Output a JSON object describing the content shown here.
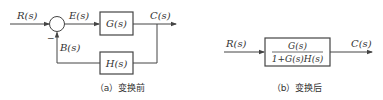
{
  "diagram_a": {
    "input_label": "R(s)",
    "error_label": "E(s)",
    "forward_block": "G(s)",
    "output_label": "C(s)",
    "feedback_signal_label": "B(s)",
    "feedback_block": "H(s)",
    "feedback_sign": "−",
    "caption": "（a）变换前"
  },
  "diagram_b": {
    "input_label": "R(s)",
    "block_numerator": "G(s)",
    "block_denominator": "1+G(s)H(s)",
    "output_label": "C(s)",
    "caption": "（b）变换后"
  },
  "colors": {
    "line": "#444444",
    "text": "#333333",
    "background": "#ffffff"
  }
}
